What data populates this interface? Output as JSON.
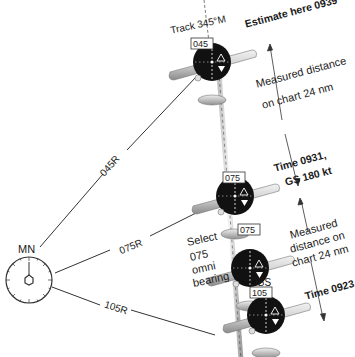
{
  "station": {
    "label": "MN"
  },
  "radials": [
    {
      "label": "045R"
    },
    {
      "label": "075R"
    },
    {
      "label": "105R"
    }
  ],
  "track_label": "Track 345°M",
  "aircraft": [
    {
      "obs_value": "045",
      "obs_caption": ""
    },
    {
      "obs_value": "075",
      "obs_caption": ""
    },
    {
      "obs_value": "075",
      "obs_caption": ""
    },
    {
      "obs_value": "105",
      "obs_caption": "OBS"
    }
  ],
  "annotations": {
    "estimate": "Estimate here 0939",
    "measured_top_1": "Measured distance",
    "measured_top_2": "on chart 24 nm",
    "time_0931_1": "Time 0931,",
    "time_0931_2": "GS 180 kt",
    "measured_bot_1": "Measured",
    "measured_bot_2": "distance on",
    "measured_bot_3": "chart 24 nm",
    "time_0923": "Time 0923",
    "select_1": "Select",
    "select_2": "075",
    "select_3": "omni",
    "select_4": "bearing"
  },
  "colors": {
    "line": "#333333",
    "instrument": "#111111",
    "wing_light": "#e6e6e6",
    "wing_dark": "#8c8c8c"
  }
}
